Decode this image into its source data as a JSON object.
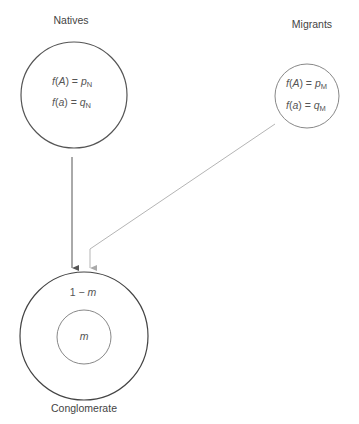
{
  "diagram": {
    "natives": {
      "title": "Natives",
      "eq1": {
        "fn": "f",
        "arg": "A",
        "rhs": "p",
        "sub": "N"
      },
      "eq2": {
        "fn": "f",
        "arg": "a",
        "rhs": "q",
        "sub": "N"
      }
    },
    "migrants": {
      "title": "Migrants",
      "eq1": {
        "fn": "f",
        "arg": "A",
        "rhs": "p",
        "sub": "M"
      },
      "eq2": {
        "fn": "f",
        "arg": "a",
        "rhs": "q",
        "sub": "M"
      }
    },
    "conglomerate": {
      "title": "Conglomerate",
      "outer_label_prefix": "1 − ",
      "outer_label_var": "m",
      "inner_label": "m"
    },
    "colors": {
      "natives_stroke": "#555555",
      "migrants_stroke": "#888888",
      "natives_arrow": "#555555",
      "migrants_arrow": "#b5b5b5",
      "conglomerate_outer": "#444444",
      "conglomerate_inner": "#888888"
    }
  }
}
